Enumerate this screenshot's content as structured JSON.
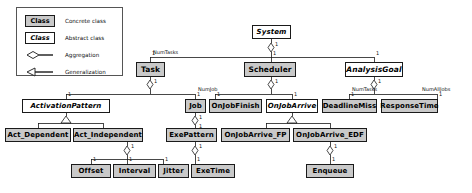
{
  "diagram": {
    "colors": {
      "concrete_fill": "#c9c9c9",
      "abstract_fill": "#ffffff",
      "stroke": "#1a1a1a",
      "legend_border": "#555555",
      "background": "#ffffff"
    }
  },
  "legend": {
    "rows": [
      {
        "sample": "Class",
        "label": "Concrete class",
        "kind": "concrete"
      },
      {
        "sample": "Class",
        "label": "Abstract class",
        "kind": "abstract"
      },
      {
        "sample": "aggregation-arrow-icon",
        "label": "Aggregation",
        "kind": "glyph"
      },
      {
        "sample": "generalization-arrow-icon",
        "label": "Generalization",
        "kind": "glyph"
      }
    ]
  },
  "classes": [
    {
      "id": "system",
      "name": "System",
      "kind": "abstract"
    },
    {
      "id": "task",
      "name": "Task",
      "kind": "concrete"
    },
    {
      "id": "scheduler",
      "name": "Scheduler",
      "kind": "concrete"
    },
    {
      "id": "analysisgoal",
      "name": "AnalysisGoal",
      "kind": "abstract"
    },
    {
      "id": "activationpattern",
      "name": "ActivationPattern",
      "kind": "abstract"
    },
    {
      "id": "job",
      "name": "Job",
      "kind": "concrete"
    },
    {
      "id": "onjobfinish",
      "name": "OnJobFinish",
      "kind": "concrete"
    },
    {
      "id": "onjobarrive",
      "name": "OnJobArrive",
      "kind": "abstract"
    },
    {
      "id": "deadlinemiss",
      "name": "DeadlineMiss",
      "kind": "concrete"
    },
    {
      "id": "responsetime",
      "name": "ResponseTime",
      "kind": "concrete"
    },
    {
      "id": "act_dependent",
      "name": "Act_Dependent",
      "kind": "concrete"
    },
    {
      "id": "act_independent",
      "name": "Act_Independent",
      "kind": "concrete"
    },
    {
      "id": "exepattern",
      "name": "ExePattern",
      "kind": "concrete"
    },
    {
      "id": "onjobarrive_fp",
      "name": "OnJobArrive_FP",
      "kind": "concrete"
    },
    {
      "id": "onjobarrive_edf",
      "name": "OnJobArrive_EDF",
      "kind": "concrete"
    },
    {
      "id": "offset",
      "name": "Offset",
      "kind": "concrete"
    },
    {
      "id": "interval",
      "name": "Interval",
      "kind": "concrete"
    },
    {
      "id": "jitter",
      "name": "Jitter",
      "kind": "concrete"
    },
    {
      "id": "exetime",
      "name": "ExeTime",
      "kind": "concrete"
    },
    {
      "id": "enqueue",
      "name": "Enqueue",
      "kind": "concrete"
    }
  ],
  "edge_labels": {
    "system_bus": "NumTasks",
    "task_job": "NumJob",
    "goal_left": "NumTasks",
    "goal_right": "NumAllJobs"
  },
  "multiplicities": {
    "system_down": "1",
    "task_top": "1",
    "scheduler_top": "1",
    "analysisgoal_top": "1",
    "task_down": "1",
    "scheduler_down": "1",
    "analysisgoal_down": "1",
    "activationpattern_top": "1",
    "job_top": "1",
    "onjobfinish_top": "1",
    "onjobarrive_top": "1",
    "deadlinemiss_top": "1",
    "responsetime_top": "1",
    "job_down": "1",
    "exepattern_top": "1",
    "act_independent_down": "1",
    "offset_top": "1",
    "interval_top": "1",
    "jitter_top": "1",
    "exepattern_down": "1",
    "exetime_top": "1",
    "onjobarrive_edf_down": "1",
    "enqueue_top": "1"
  }
}
